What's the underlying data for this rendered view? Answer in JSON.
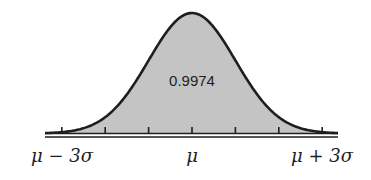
{
  "chart_data": {
    "type": "area",
    "title": "",
    "annotation": "0.9974",
    "xlabel": "",
    "ylabel": "",
    "x_ticks_sigma": [
      -3,
      -2,
      -1,
      0,
      1,
      2,
      3
    ],
    "tick_labels": [
      {
        "sigma": -3,
        "label": "μ − 3σ"
      },
      {
        "sigma": 0,
        "label": "μ"
      },
      {
        "sigma": 3,
        "label": "μ + 3σ"
      }
    ],
    "shaded_range_sigma": [
      -3,
      3
    ],
    "shaded_probability": 0.9974,
    "grid": false,
    "legend": null
  },
  "colors": {
    "fill": "#c4c4c4",
    "stroke": "#1e1e1e",
    "background": "#ffffff"
  },
  "labels": {
    "area_value": "0.9974",
    "left": "μ − 3σ",
    "center": "μ",
    "right": "μ + 3σ"
  }
}
